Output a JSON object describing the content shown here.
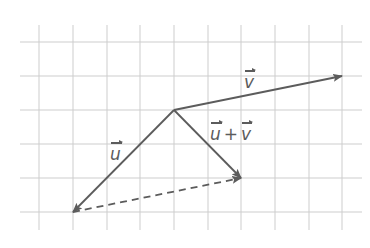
{
  "diagram": {
    "type": "vector-addition",
    "colors": {
      "grid": "#cdcdcd",
      "vector": "#5c5c5c",
      "label": "#5c5c5c"
    },
    "grid": {
      "x_lines": [
        39,
        73,
        107,
        140,
        174,
        208,
        241,
        275,
        309,
        342
      ],
      "y_lines": [
        42,
        76,
        110,
        144,
        178,
        212
      ],
      "x_extent": [
        20,
        362
      ],
      "y_extent": [
        25,
        230
      ],
      "cell_size": 33.6
    },
    "origin": {
      "x": 174,
      "y": 110
    },
    "vectors": [
      {
        "id": "v",
        "label": "v",
        "from": [
          174,
          110
        ],
        "to": [
          342,
          76
        ],
        "style": "solid",
        "grid_components": [
          5,
          1
        ]
      },
      {
        "id": "u",
        "label": "u",
        "from": [
          174,
          110
        ],
        "to": [
          73,
          212
        ],
        "style": "solid",
        "grid_components": [
          -3,
          -3
        ]
      },
      {
        "id": "u_plus_v",
        "label": "u + v",
        "from": [
          174,
          110
        ],
        "to": [
          241,
          178
        ],
        "style": "solid",
        "grid_components": [
          2,
          -2
        ]
      },
      {
        "id": "translated_v",
        "label": "",
        "from": [
          73,
          212
        ],
        "to": [
          241,
          178
        ],
        "style": "dashed",
        "grid_components": [
          5,
          1
        ]
      }
    ],
    "labels": {
      "v": "v",
      "u": "u",
      "sum_left": "u",
      "sum_plus": "+",
      "sum_right": "v"
    }
  }
}
